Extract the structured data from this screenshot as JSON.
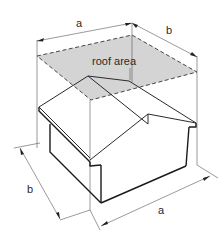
{
  "diagram": {
    "labels": {
      "roof_area": "roof area",
      "top_width": "a",
      "top_depth": "b",
      "bottom_width": "a",
      "bottom_depth": "b"
    },
    "colors": {
      "roof_fill": "#d4d4d4",
      "line": "#1a1a1a",
      "background": "#ffffff"
    }
  }
}
